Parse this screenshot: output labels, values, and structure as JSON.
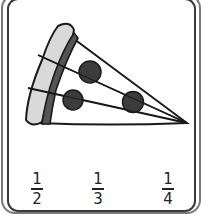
{
  "card": {
    "image": "pizza-slice-icon",
    "slice_cuts": 3,
    "pepperoni_count": 3
  },
  "choices": [
    {
      "numerator": "1",
      "denominator": "2"
    },
    {
      "numerator": "1",
      "denominator": "3"
    },
    {
      "numerator": "1",
      "denominator": "4"
    }
  ],
  "colors": {
    "outline": "#1a1a1a",
    "crust": "#d9d9d9",
    "sauce": "#555555",
    "pepperoni": "#3c3c3c",
    "cheese": "#ffffff"
  }
}
